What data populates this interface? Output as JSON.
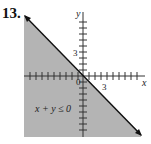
{
  "problem": {
    "number": "13."
  },
  "graph": {
    "inequality": "x + y ≤ 0",
    "x_axis_label": "x",
    "y_axis_label": "y",
    "origin_label": "0",
    "x_tick_label": "3",
    "y_tick_label": "3",
    "boundary_line": "x + y = 0",
    "shaded_side": "below-left",
    "colors": {
      "shade": "#b4b4b4",
      "line": "#111111",
      "axis": "#333333"
    }
  }
}
